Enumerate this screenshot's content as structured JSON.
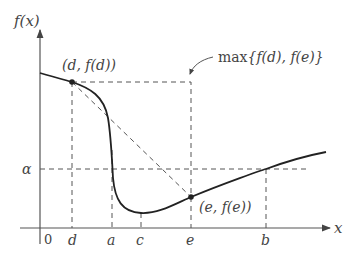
{
  "diagram": {
    "type": "function-plot",
    "axes": {
      "y_label": "f(x)",
      "x_label": "x",
      "origin_label": "0"
    },
    "x_ticks": [
      {
        "name": "d",
        "label": "d"
      },
      {
        "name": "a",
        "label": "a"
      },
      {
        "name": "c",
        "label": "c"
      },
      {
        "name": "e",
        "label": "e"
      },
      {
        "name": "b",
        "label": "b"
      }
    ],
    "y_ticks": [
      {
        "name": "alpha",
        "label": "α"
      }
    ],
    "points": [
      {
        "name": "d-point",
        "label": "(d, f(d))"
      },
      {
        "name": "e-point",
        "label": "(e, f(e))"
      }
    ],
    "annotation": {
      "prefix": "max",
      "text": "{f(d), f(e)}"
    },
    "colors": {
      "curve": "#222222",
      "axis": "#555555",
      "dashed": "#555555",
      "text": "#444444"
    }
  }
}
